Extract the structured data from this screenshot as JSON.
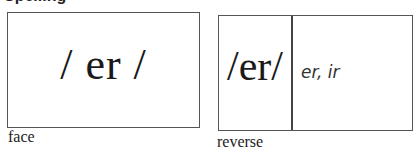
{
  "heading": {
    "text": "Spelling"
  },
  "face_card": {
    "sound": "/ er /",
    "caption": "face"
  },
  "reverse_card": {
    "sound": "/er/",
    "spellings": "er, ir",
    "caption": "reverse"
  }
}
